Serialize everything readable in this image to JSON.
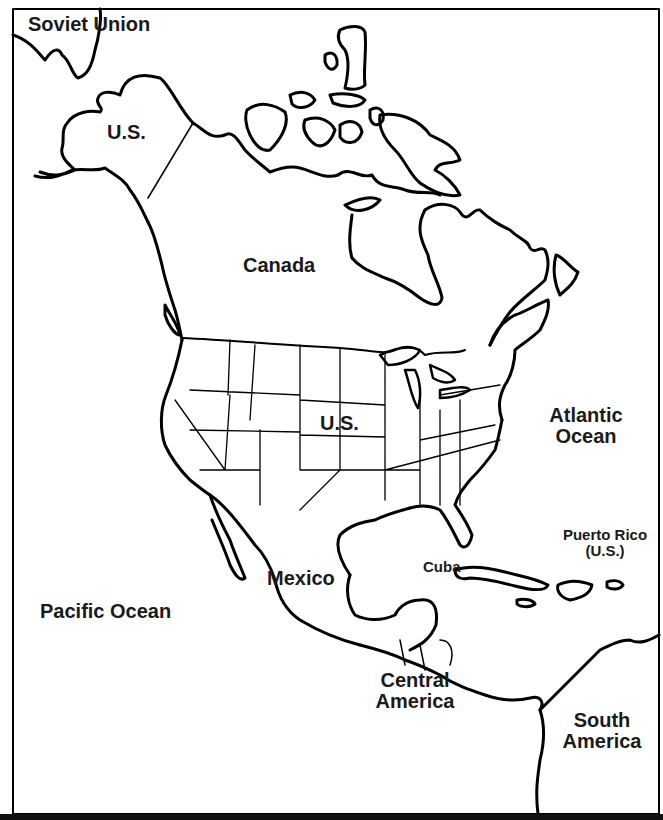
{
  "map": {
    "title_region": "North America",
    "style": {
      "line_color": "#000000",
      "background": "#ffffff"
    },
    "labels": {
      "soviet_union": "Soviet Union",
      "us_alaska": "U.S.",
      "canada": "Canada",
      "us_mainland": "U.S.",
      "atlantic_line1": "Atlantic",
      "atlantic_line2": "Ocean",
      "puerto_rico_line1": "Puerto Rico",
      "puerto_rico_line2": "(U.S.)",
      "cuba": "Cuba",
      "mexico": "Mexico",
      "pacific": "Pacific Ocean",
      "central_line1": "Central",
      "central_line2": "America",
      "south_line1": "South",
      "south_line2": "America"
    }
  }
}
